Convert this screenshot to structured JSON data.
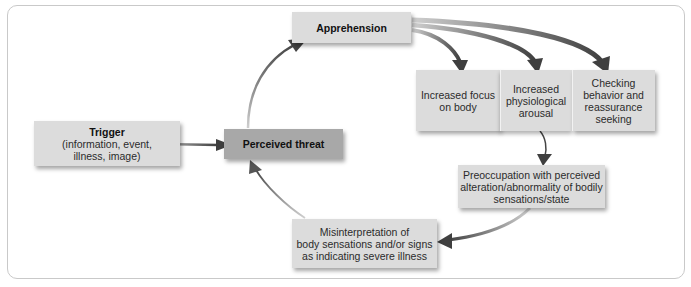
{
  "diagram": {
    "nodes": {
      "apprehension": {
        "title": "Apprehension"
      },
      "trigger": {
        "title": "Trigger",
        "lines": [
          "(information, event,",
          "illness,  image)"
        ]
      },
      "perceived_threat": {
        "title": "Perceived threat"
      },
      "focus": {
        "lines": [
          "Increased focus",
          "on body"
        ]
      },
      "arousal": {
        "lines": [
          "Increased",
          "physiological",
          "arousal"
        ]
      },
      "checking": {
        "lines": [
          "Checking",
          "behavior and",
          "reassurance",
          "seeking"
        ]
      },
      "preoccupation": {
        "lines": [
          "Preoccupation with perceived",
          "alteration/abnormality of bodily",
          "sensations/state"
        ]
      },
      "misinterpretation": {
        "lines": [
          "Misinterpretation of",
          "body sensations and/or signs",
          "as indicating severe illness"
        ]
      }
    },
    "edges": [
      {
        "from": "trigger",
        "to": "perceived_threat"
      },
      {
        "from": "perceived_threat",
        "to": "apprehension"
      },
      {
        "from": "apprehension",
        "to": "focus"
      },
      {
        "from": "apprehension",
        "to": "arousal"
      },
      {
        "from": "apprehension",
        "to": "checking"
      },
      {
        "from": "arousal",
        "to": "preoccupation"
      },
      {
        "from": "preoccupation",
        "to": "misinterpretation"
      },
      {
        "from": "misinterpretation",
        "to": "perceived_threat"
      }
    ],
    "colors": {
      "box_fill": "#dcdcdc",
      "threat_fill": "#a8a8a8",
      "arrow": "#4a4a4a",
      "frame_border": "#c9c9c9"
    }
  }
}
